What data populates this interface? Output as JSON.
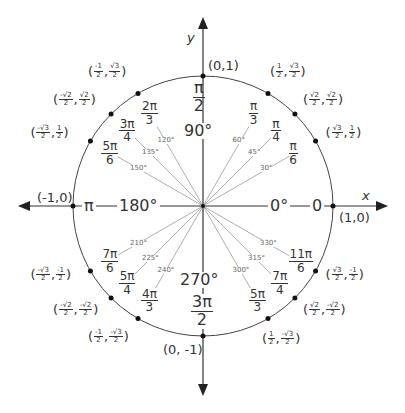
{
  "diagram": {
    "axes": {
      "x_label": "x",
      "y_label": "y"
    },
    "axis_points": [
      {
        "name": "east",
        "coord": "(1,0)",
        "radian": "0",
        "degree": "0°"
      },
      {
        "name": "north",
        "coord": "(0,1)",
        "radian_num": "π",
        "radian_den": "2",
        "degree": "90°"
      },
      {
        "name": "west",
        "coord": "(-1,0)",
        "radian": "π",
        "degree": "180°"
      },
      {
        "name": "south",
        "coord": "(0, -1)",
        "radian_num": "3π",
        "radian_den": "2",
        "degree": "270°"
      }
    ],
    "angles": [
      {
        "deg": 30,
        "degree": "30°",
        "rad_num": "π",
        "rad_den": "6",
        "x_num": "√3",
        "x_den": "2",
        "y_num": "1",
        "y_den": "2"
      },
      {
        "deg": 45,
        "degree": "45°",
        "rad_num": "π",
        "rad_den": "4",
        "x_num": "√2",
        "x_den": "2",
        "y_num": "√2",
        "y_den": "2"
      },
      {
        "deg": 60,
        "degree": "60°",
        "rad_num": "π",
        "rad_den": "3",
        "x_num": "1",
        "x_den": "2",
        "y_num": "√3",
        "y_den": "2"
      },
      {
        "deg": 120,
        "degree": "120°",
        "rad_num": "2π",
        "rad_den": "3",
        "x_num": "-1",
        "x_den": "2",
        "y_num": "√3",
        "y_den": "2"
      },
      {
        "deg": 135,
        "degree": "135°",
        "rad_num": "3π",
        "rad_den": "4",
        "x_num": "-√2",
        "x_den": "2",
        "y_num": "√2",
        "y_den": "2"
      },
      {
        "deg": 150,
        "degree": "150°",
        "rad_num": "5π",
        "rad_den": "6",
        "x_num": "-√3",
        "x_den": "2",
        "y_num": "1",
        "y_den": "2"
      },
      {
        "deg": 210,
        "degree": "210°",
        "rad_num": "7π",
        "rad_den": "6",
        "x_num": "-√3",
        "x_den": "2",
        "y_num": "-1",
        "y_den": "2"
      },
      {
        "deg": 225,
        "degree": "225°",
        "rad_num": "5π",
        "rad_den": "4",
        "x_num": "-√2",
        "x_den": "2",
        "y_num": "-√2",
        "y_den": "2"
      },
      {
        "deg": 240,
        "degree": "240°",
        "rad_num": "4π",
        "rad_den": "3",
        "x_num": "-1",
        "x_den": "2",
        "y_num": "-√3",
        "y_den": "2"
      },
      {
        "deg": 300,
        "degree": "300°",
        "rad_num": "5π",
        "rad_den": "3",
        "x_num": "1",
        "x_den": "2",
        "y_num": "-√3",
        "y_den": "2"
      },
      {
        "deg": 315,
        "degree": "315°",
        "rad_num": "7π",
        "rad_den": "4",
        "x_num": "√2",
        "x_den": "2",
        "y_num": "-√2",
        "y_den": "2"
      },
      {
        "deg": 330,
        "degree": "330°",
        "rad_num": "11π",
        "rad_den": "6",
        "x_num": "√3",
        "x_den": "2",
        "y_num": "-1",
        "y_den": "2"
      }
    ]
  }
}
